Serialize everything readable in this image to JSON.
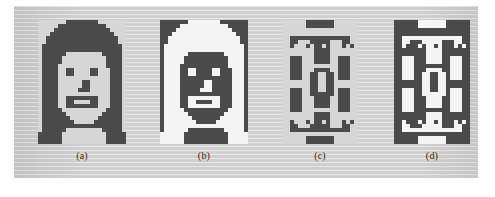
{
  "figure": {
    "background_color": "#cfcfcf",
    "page_color": "#ffffff",
    "ink_color": "#4a4a4a",
    "paper_color": "#f2f2f2",
    "panel": {
      "left": 14,
      "top": 6,
      "width": 464,
      "height": 172
    },
    "panels": [
      {
        "id": "a",
        "caption": "(a)",
        "name": "face-pattern",
        "left": 24,
        "top": 14,
        "cell": 4,
        "cols": 22,
        "rows": 31,
        "fg": "#4a4a4a",
        "bg": "#d6d6d6",
        "note": "dark hair, light face",
        "pixels": [
          "0000000111111110000000",
          "0000011111111111100000",
          "0000111111111111110000",
          "0001111111111111111000",
          "0011111111111111111100",
          "0011111111111111111100",
          "0111111111111111111110",
          "0111111111111111111110",
          "0111111000000000111110",
          "0111110000000000011110",
          "0111110000000000011110",
          "0111100000000000011110",
          "0111100110000110001110",
          "0111100110000110001110",
          "0111100000000000001110",
          "0111100000011000001110",
          "0111100000011000001110",
          "0111100000111000001110",
          "0111100000000000001110",
          "0111100111111110001110",
          "0111100110000110001110",
          "0111100111111110001110",
          "0111110000000000011110",
          "0111111000000000111110",
          "0111111100000001111110",
          "0111111110000011111110",
          "0111111111111111111110",
          "0111111000000000111110",
          "1111110000000000011111",
          "1111110000000000011111",
          "1111110000000000011111"
        ]
      },
      {
        "id": "b",
        "caption": "(b)",
        "name": "face-pattern-complement",
        "left": 146,
        "top": 14,
        "cell": 4,
        "cols": 22,
        "rows": 31,
        "fg": "#4a4a4a",
        "bg": "#f4f4f4",
        "note": "complement of (a): light hair, dark face",
        "pixels": [
          "1111111000000001111111",
          "1111100000000000011111",
          "1111000000000000001111",
          "1110000000000000000111",
          "1100000000000000000011",
          "1100000000000000000011",
          "1000000000000000000001",
          "1000000000000000000001",
          "1000000111111111000001",
          "1000001111111111100001",
          "1000001111111111100001",
          "1000011111111111100001",
          "1000011001111001110001",
          "1000011001111001110001",
          "1000011111111111110001",
          "1000011111100111110001",
          "1000011111100111110001",
          "1000011111000111110001",
          "1000011111111111110001",
          "1000011000000001110001",
          "1000011001111001110001",
          "1000011000000001110001",
          "1000001111111111100001",
          "1000000111111111000001",
          "1000000011111110000001",
          "1000000001111100000001",
          "1000000000000000000001",
          "1000000111111111000001",
          "0000001111111111100000",
          "0000001111111111100000",
          "0000001111111111100000"
        ]
      },
      {
        "id": "c",
        "caption": "(c)",
        "name": "zhong-seal-pattern",
        "left": 268,
        "top": 14,
        "cell": 4,
        "cols": 19,
        "rows": 31,
        "fg": "#4a4a4a",
        "bg": "#d6d6d6",
        "note": "dark frame with white seal ornament and zhong character",
        "pixels": [
          "0000001111111000000",
          "0000001111111000000",
          "0000000000000000000",
          "0000000000000000000",
          "0011111111111111100",
          "0011000111110001100",
          "0010001011010001010",
          "0000000011110000000",
          "0000000011110000000",
          "0011100011110011100",
          "0011100011110011100",
          "0011100000000011100",
          "0011100011110011100",
          "0011100110011011100",
          "0011100110011011100",
          "0000000110011000000",
          "0000000110011000000",
          "0011100110011011100",
          "0011100111111011100",
          "0011100011110011100",
          "0011100011110011100",
          "0011100011110011100",
          "0011100000000011100",
          "0000000011110000000",
          "0000000011110000000",
          "0010001011010001010",
          "0011000111110001100",
          "0011111111111111100",
          "0000000000000000000",
          "0000001111111000000",
          "0000001111111000000"
        ]
      },
      {
        "id": "d",
        "caption": "(d)",
        "name": "zhong-seal-pattern-complement",
        "left": 380,
        "top": 14,
        "cell": 4,
        "cols": 19,
        "rows": 31,
        "fg": "#4a4a4a",
        "bg": "#f4f4f4",
        "note": "complement of (c)",
        "pixels": [
          "1111110000000111111",
          "1111110000000111111",
          "1111111111111111111",
          "1111111111111111111",
          "1100000000000000011",
          "1100111000001110011",
          "1101110100101110101",
          "1111111100001111111",
          "1111111100001111111",
          "1100011100001100011",
          "1100011100001100011",
          "1100011111111100011",
          "1100011100001100011",
          "1100011001100100011",
          "1100011001100100011",
          "1111111001100111111",
          "1111111001100111111",
          "1100011001100100011",
          "1100011000000100011",
          "1100011100001100011",
          "1100011100001100011",
          "1100011100001100011",
          "1100011111111100011",
          "1111111100001111111",
          "1111111100001111111",
          "1101110100101110101",
          "1100111000001110011",
          "1100000000000000011",
          "1111111111111111111",
          "1111110000000111111",
          "1111110000000111111"
        ]
      }
    ]
  }
}
